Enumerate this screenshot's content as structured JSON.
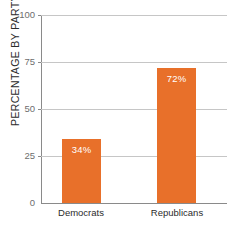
{
  "chart_data": {
    "type": "bar",
    "title": "",
    "title_cropped": true,
    "xlabel": "",
    "ylabel": "PERCENTAGE BY PARTY",
    "categories": [
      "Democrats",
      "Republicans"
    ],
    "values": [
      34,
      72
    ],
    "value_labels": [
      "34%",
      "72%"
    ],
    "ylim": [
      0,
      100
    ],
    "yticks": [
      0,
      25,
      50,
      75,
      100
    ],
    "ytick_labels": [
      "0",
      "25",
      "50",
      "75",
      "100"
    ],
    "grid": true,
    "legend": false,
    "series": [
      {
        "name": "Percentage by party",
        "values": [
          34,
          72
        ],
        "color": "#e8702a"
      }
    ]
  },
  "colors": {
    "bar": "#e8702a",
    "gridline": "#c6c6c6",
    "axis": "#8a8a8a",
    "tick_text": "#6e6e6e",
    "label_text": "#2b2b2b",
    "value_text": "#ffffff",
    "background": "#ffffff"
  },
  "axis": {
    "y_title": "PERCENTAGE BY PARTY",
    "ticks": [
      {
        "label": "100",
        "value": 100
      },
      {
        "label": "75",
        "value": 75
      },
      {
        "label": "50",
        "value": 50
      },
      {
        "label": "25",
        "value": 25
      },
      {
        "label": "0",
        "value": 0
      }
    ]
  },
  "bars": [
    {
      "category": "Democrats",
      "value": 34,
      "value_label": "34%"
    },
    {
      "category": "Republicans",
      "value": 72,
      "value_label": "72%"
    }
  ],
  "title_remnant": ""
}
